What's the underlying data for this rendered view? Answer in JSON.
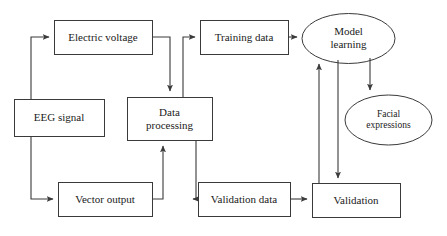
{
  "diagram": {
    "type": "flowchart",
    "title": "",
    "background_color": "#ffffff",
    "stroke_color": "#3a3a3a",
    "text_color": "#1a1a1a",
    "nodes": [
      {
        "id": "electric-voltage",
        "label": "Electric voltage",
        "shape": "rect",
        "x": 54,
        "y": 20,
        "w": 98,
        "h": 34
      },
      {
        "id": "eeg-signal",
        "label": "EEG signal",
        "shape": "rect",
        "x": 14,
        "y": 99,
        "w": 90,
        "h": 37
      },
      {
        "id": "vector-output",
        "label": "Vector output",
        "shape": "rect",
        "x": 58,
        "y": 182,
        "w": 94,
        "h": 34
      },
      {
        "id": "data-processing",
        "label": "Data\nprocessing",
        "shape": "rect",
        "x": 127,
        "y": 97,
        "w": 85,
        "h": 43
      },
      {
        "id": "training-data",
        "label": "Training data",
        "shape": "rect",
        "x": 200,
        "y": 20,
        "w": 88,
        "h": 34
      },
      {
        "id": "validation-data",
        "label": "Validation data",
        "shape": "rect",
        "x": 198,
        "y": 182,
        "w": 92,
        "h": 34
      },
      {
        "id": "model-learning",
        "label": "Model\nlearning",
        "shape": "ellipse",
        "x": 302,
        "y": 13,
        "w": 93,
        "h": 50
      },
      {
        "id": "facial-expressions",
        "label": "Facial\nexpressions",
        "shape": "ellipse",
        "x": 345,
        "y": 95,
        "w": 87,
        "h": 50
      },
      {
        "id": "validation",
        "label": "Validation",
        "shape": "rect",
        "x": 312,
        "y": 183,
        "w": 88,
        "h": 34
      }
    ],
    "edges": [
      {
        "id": "eeg-to-electric-voltage",
        "from": "eeg-signal",
        "to": "electric-voltage"
      },
      {
        "id": "eeg-to-vector-output",
        "from": "eeg-signal",
        "to": "vector-output"
      },
      {
        "id": "electric-voltage-to-processing",
        "from": "electric-voltage",
        "to": "data-processing"
      },
      {
        "id": "vector-output-to-processing",
        "from": "vector-output",
        "to": "data-processing"
      },
      {
        "id": "processing-to-training-data",
        "from": "data-processing",
        "to": "training-data"
      },
      {
        "id": "processing-to-validation-data",
        "from": "data-processing",
        "to": "validation-data"
      },
      {
        "id": "training-data-to-model",
        "from": "training-data",
        "to": "model-learning"
      },
      {
        "id": "validation-data-to-validation",
        "from": "validation-data",
        "to": "validation"
      },
      {
        "id": "validation-to-model",
        "from": "validation",
        "to": "model-learning"
      },
      {
        "id": "model-to-validation",
        "from": "model-learning",
        "to": "validation"
      },
      {
        "id": "model-to-facial-expressions",
        "from": "model-learning",
        "to": "facial-expressions"
      }
    ]
  }
}
